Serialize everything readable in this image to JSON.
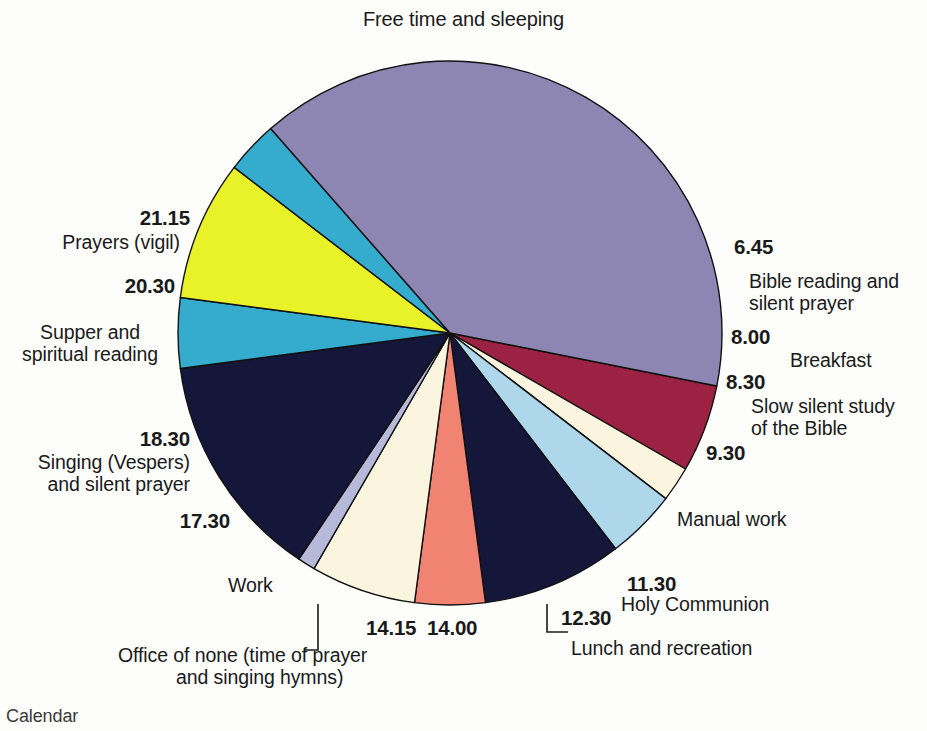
{
  "figure": {
    "title": "Free time and sleeping",
    "caption_partial": "Calendar",
    "background": "#fdfdfb"
  },
  "chart_data": {
    "type": "pie",
    "title": "Free time and sleeping",
    "subtitle": "",
    "xlabel": "",
    "ylabel": "",
    "legend_position": "none",
    "grid": false,
    "note": "Monastic daily timetable drawn as a 24-hour clock pie. Each slice spans from its start time to the next slice's start time; slice size in hours is given by 'hours'.",
    "total_hours": 24,
    "categories": [
      "Bible reading and silent prayer",
      "Breakfast",
      "Slow silent study of the Bible",
      "Manual work",
      "Holy Communion",
      "Lunch and recreation",
      "Office of none (time of prayer and singing hymns)",
      "Work",
      "Singing (Vespers) and silent prayer",
      "Supper and spiritual reading",
      "Prayers (vigil)",
      "Free time and sleeping"
    ],
    "values": [
      1.25,
      0.5,
      1,
      2,
      1,
      1.5,
      0.25,
      3.25,
      1,
      2,
      0.75,
      9.5
    ],
    "slices": [
      {
        "start": "6.45",
        "end": "8.00",
        "label": "Bible reading and",
        "label2": "silent prayer",
        "hours": 1.25,
        "color": "#9b2242",
        "start_deg": 101.25,
        "end_deg": 120.0
      },
      {
        "start": "8.00",
        "end": "8.30",
        "label": "Breakfast",
        "label2": "",
        "hours": 0.5,
        "color": "#fbf5df",
        "start_deg": 120.0,
        "end_deg": 127.5
      },
      {
        "start": "8.30",
        "end": "9.30",
        "label": "Slow silent study",
        "label2": "of the Bible",
        "hours": 1.0,
        "color": "#aed7ec",
        "start_deg": 127.5,
        "end_deg": 142.5
      },
      {
        "start": "9.30",
        "end": "11.30",
        "label": "Manual work",
        "label2": "",
        "hours": 2.0,
        "color": "#141739",
        "start_deg": 142.5,
        "end_deg": 172.5
      },
      {
        "start": "11.30",
        "end": "12.30",
        "label": "Holy Communion",
        "label2": "",
        "hours": 1.0,
        "color": "#f08371",
        "start_deg": 172.5,
        "end_deg": 187.5
      },
      {
        "start": "12.30",
        "end": "14.00",
        "label": "Lunch and recreation",
        "label2": "",
        "hours": 1.5,
        "color": "#fbf5df",
        "start_deg": 187.5,
        "end_deg": 210.0
      },
      {
        "start": "14.00",
        "end": "14.15",
        "label": "Office of none (time of prayer",
        "label2": "and singing hymns)",
        "hours": 0.25,
        "color": "#b6b9d9",
        "start_deg": 210.0,
        "end_deg": 213.75
      },
      {
        "start": "14.15",
        "end": "17.30",
        "label": "Work",
        "label2": "",
        "hours": 3.25,
        "color": "#141739",
        "start_deg": 213.75,
        "end_deg": 262.5
      },
      {
        "start": "17.30",
        "end": "18.30",
        "label": "Singing (Vespers)",
        "label2": "and silent prayer",
        "hours": 1.0,
        "color": "#35abce",
        "start_deg": 262.5,
        "end_deg": 277.5
      },
      {
        "start": "18.30",
        "end": "20.30",
        "label": "Supper and",
        "label2": "spiritual reading",
        "hours": 2.0,
        "color": "#e9f129",
        "start_deg": 277.5,
        "end_deg": 307.5
      },
      {
        "start": "20.30",
        "end": "21.15",
        "label": "Prayers (vigil)",
        "label2": "",
        "hours": 0.75,
        "color": "#35abce",
        "start_deg": 307.5,
        "end_deg": 318.75
      },
      {
        "start": "21.15",
        "end": "6.45",
        "label": "Free time and sleeping",
        "label2": "",
        "hours": 9.5,
        "color": "#8d85b2",
        "start_deg": 318.75,
        "end_deg": 461.25
      }
    ],
    "colors": [
      "#9b2242",
      "#fbf5df",
      "#aed7ec",
      "#141739",
      "#f08371",
      "#fbf5df",
      "#b6b9d9",
      "#141739",
      "#35abce",
      "#e9f129",
      "#35abce",
      "#8d85b2"
    ],
    "geometry": {
      "cx": 450,
      "cy": 333,
      "r": 272,
      "stroke": "#111111",
      "stroke_width": 1.4
    }
  },
  "labels": {
    "t_645": "6.45",
    "n_645_l1": "Bible reading and",
    "n_645_l2": "silent prayer",
    "t_800": "8.00",
    "n_800": "Breakfast",
    "t_830": "8.30",
    "n_830_l1": "Slow silent study",
    "n_830_l2": "of the Bible",
    "t_930": "9.30",
    "n_930": "Manual work",
    "t_1130": "11.30",
    "n_1130": "Holy Communion",
    "t_1230": "12.30",
    "n_1230": "Lunch and recreation",
    "t_1400": "14.00",
    "t_1415": "14.15",
    "n_1400_l1": "Office of none (time of prayer",
    "n_1400_l2": "and singing hymns)",
    "t_1730": "17.30",
    "n_work": "Work",
    "t_1830": "18.30",
    "n_1830_l1": "Singing (Vespers)",
    "n_1830_l2": "and silent prayer",
    "t_2030": "20.30",
    "n_2030_l1": "Supper and",
    "n_2030_l2": "spiritual reading",
    "t_2115": "21.15",
    "n_2115": "Prayers (vigil)",
    "n_free": "Free time and sleeping"
  }
}
